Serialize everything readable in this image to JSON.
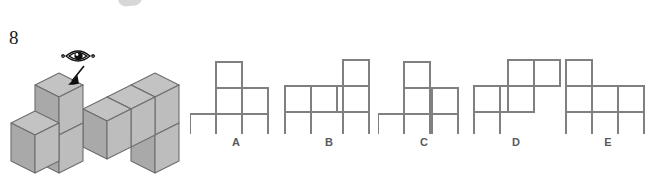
{
  "question": {
    "number": "8",
    "viewpoint_icon": "eye-icon",
    "direction_icon": "arrow-down-left-icon"
  },
  "colors": {
    "cube_top": "#c3c3c3",
    "cube_left": "#a9a9a9",
    "cube_right": "#bcbcbc",
    "cube_outline": "#6e6e6e",
    "net_stroke": "#808080",
    "label_text": "#5a5a5a",
    "number_text": "#1a1a1a",
    "background": "#ffffff"
  },
  "figure": {
    "name": "isometric-cube-solid",
    "cube_size_px": 38,
    "cube_count": 9,
    "cells": [
      {
        "id": "c1",
        "x": 0,
        "y": 0,
        "z": 0
      },
      {
        "id": "c2",
        "x": 1,
        "y": 0,
        "z": 0
      },
      {
        "id": "c3",
        "x": 1,
        "y": 0,
        "z": 1
      },
      {
        "id": "c4",
        "x": 1,
        "y": 0,
        "z": 2
      },
      {
        "id": "c5",
        "x": 2,
        "y": 0,
        "z": 1
      },
      {
        "id": "c6",
        "x": 3,
        "y": 0,
        "z": 1
      },
      {
        "id": "c7",
        "x": 3,
        "y": 0,
        "z": 0
      },
      {
        "id": "c8",
        "x": 4,
        "y": 0,
        "z": 1
      },
      {
        "id": "c9",
        "x": 4,
        "y": 0,
        "z": 0
      }
    ]
  },
  "options": [
    {
      "id": "A",
      "label": "A",
      "name": "option-a",
      "grid_cols": 3,
      "grid_rows": 3,
      "cells": [
        {
          "col": 1,
          "row": 0
        },
        {
          "col": 1,
          "row": 1
        },
        {
          "col": 2,
          "row": 1
        },
        {
          "col": 0,
          "row": 2
        },
        {
          "col": 1,
          "row": 2
        },
        {
          "col": 2,
          "row": 2
        }
      ]
    },
    {
      "id": "B",
      "label": "B",
      "name": "option-b",
      "grid_cols": 4,
      "grid_rows": 3,
      "cells": [
        {
          "col": 3,
          "row": 0
        },
        {
          "col": 0,
          "row": 1
        },
        {
          "col": 1,
          "row": 1
        },
        {
          "col": 2,
          "row": 1
        },
        {
          "col": 3,
          "row": 1
        },
        {
          "col": 0,
          "row": 2
        },
        {
          "col": 3,
          "row": 2
        }
      ]
    },
    {
      "id": "C",
      "label": "C",
      "name": "option-c",
      "grid_cols": 3,
      "grid_rows": 3,
      "cells": [
        {
          "col": 1,
          "row": 0
        },
        {
          "col": 1,
          "row": 1
        },
        {
          "col": 2,
          "row": 1
        },
        {
          "col": 0,
          "row": 2
        },
        {
          "col": 1,
          "row": 2
        },
        {
          "col": 2,
          "row": 2
        }
      ]
    },
    {
      "id": "D",
      "label": "D",
      "name": "option-d",
      "grid_cols": 4,
      "grid_rows": 3,
      "cells": [
        {
          "col": 2,
          "row": 0
        },
        {
          "col": 3,
          "row": 0
        },
        {
          "col": 0,
          "row": 1
        },
        {
          "col": 1,
          "row": 1
        },
        {
          "col": 2,
          "row": 1
        },
        {
          "col": 0,
          "row": 2
        }
      ]
    },
    {
      "id": "E",
      "label": "E",
      "name": "option-e",
      "grid_cols": 3,
      "grid_rows": 3,
      "cells": [
        {
          "col": 0,
          "row": 0
        },
        {
          "col": 0,
          "row": 1
        },
        {
          "col": 1,
          "row": 1
        },
        {
          "col": 2,
          "row": 1
        },
        {
          "col": 0,
          "row": 2
        },
        {
          "col": 2,
          "row": 2
        }
      ]
    }
  ]
}
